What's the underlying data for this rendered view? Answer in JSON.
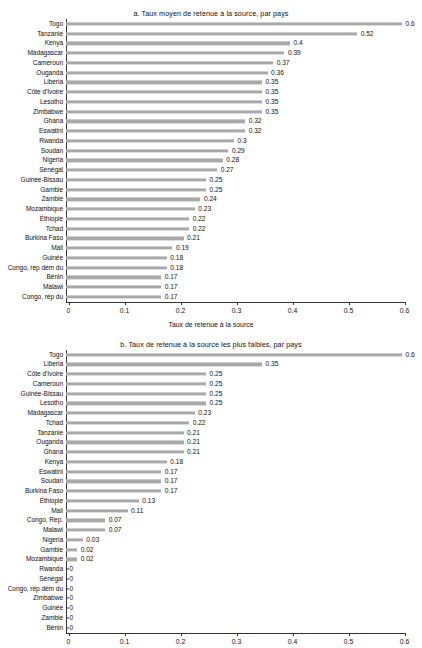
{
  "figure": {
    "panels": [
      {
        "id": "panel-a",
        "title": "a. Taux moyen de retenue à la source, par pays",
        "xlabel": "Taux de retenue à la source",
        "xticks": [
          "0",
          "0.1",
          "0.2",
          "0.3",
          "0.4",
          "0.5",
          "0.6"
        ]
      },
      {
        "id": "panel-b",
        "title": "b. Taux de retenue à la source les plus faibles, par pays",
        "xlabel": "",
        "xticks": [
          "0",
          "0.1",
          "0.2",
          "0.3",
          "0.4",
          "0.5",
          "0.6"
        ]
      }
    ]
  },
  "chart_data": [
    {
      "type": "bar",
      "orientation": "horizontal",
      "title": "a. Taux moyen de retenue à la source, par pays",
      "xlabel": "Taux de retenue à la source",
      "ylabel": "",
      "xlim": [
        0,
        0.6
      ],
      "xticks": [
        0,
        0.1,
        0.2,
        0.3,
        0.4,
        0.5,
        0.6
      ],
      "grid": false,
      "legend": "none",
      "bar_color": "#a9a9a9",
      "categories": [
        "Togo",
        "Tanzanie",
        "Kenya",
        "Madagascar",
        "Cameroun",
        "Ouganda",
        "Liberia",
        "Côte d'Ivoire",
        "Lesotho",
        "Zimbabwe",
        "Ghana",
        "Eswatini",
        "Rwanda",
        "Soudan",
        "Nigeria",
        "Sénégal",
        "Guinée-Bissau",
        "Gambie",
        "Zambie",
        "Mozambique",
        "Éthiopie",
        "Tchad",
        "Burkina Faso",
        "Mali",
        "Guinée",
        "Congo, rép dém du",
        "Bénin",
        "Malawi",
        "Congo, rép du"
      ],
      "values": [
        0.6,
        0.52,
        0.4,
        0.39,
        0.37,
        0.36,
        0.35,
        0.35,
        0.35,
        0.35,
        0.32,
        0.32,
        0.3,
        0.29,
        0.28,
        0.27,
        0.25,
        0.25,
        0.24,
        0.23,
        0.22,
        0.22,
        0.21,
        0.19,
        0.18,
        0.18,
        0.17,
        0.17,
        0.17
      ],
      "labels": [
        "0.6",
        "0.52",
        "0.4",
        "0.39",
        "0.37",
        "0.36",
        "0.35",
        "0.35",
        "0.35",
        "0.35",
        "0.32",
        "0.32",
        "0.3",
        "0.29",
        "0.28",
        "0.27",
        "0.25",
        "0.25",
        "0.24",
        "0.23",
        "0.22",
        "0.22",
        "0.21",
        "0.19",
        "0.18",
        "0.18",
        "0.17",
        "0.17",
        "0.17"
      ]
    },
    {
      "type": "bar",
      "orientation": "horizontal",
      "title": "b. Taux de retenue à la source les plus faibles, par pays",
      "xlabel": "",
      "ylabel": "",
      "xlim": [
        0,
        0.6
      ],
      "xticks": [
        0,
        0.1,
        0.2,
        0.3,
        0.4,
        0.5,
        0.6
      ],
      "grid": false,
      "legend": "none",
      "bar_color": "#a9a9a9",
      "categories": [
        "Togo",
        "Liberia",
        "Côte d'Ivoire",
        "Cameroun",
        "Guinée-Bissau",
        "Lesotho",
        "Madagascar",
        "Tchad",
        "Tanzanie",
        "Ouganda",
        "Ghana",
        "Kenya",
        "Eswatini",
        "Soudan",
        "Burkina Faso",
        "Éthiopie",
        "Mali",
        "Congo, Rep.",
        "Malawi",
        "Nigeria",
        "Gambie",
        "Mozambique",
        "Rwanda",
        "Sénégal",
        "Congo, rép dém du",
        "Zimbabwe",
        "Guinée",
        "Zambie",
        "Bénin"
      ],
      "values": [
        0.6,
        0.35,
        0.25,
        0.25,
        0.25,
        0.25,
        0.23,
        0.22,
        0.21,
        0.21,
        0.21,
        0.18,
        0.17,
        0.17,
        0.17,
        0.13,
        0.11,
        0.07,
        0.07,
        0.03,
        0.02,
        0.02,
        0,
        0,
        0,
        0,
        0,
        0,
        0
      ],
      "labels": [
        "0.6",
        "0.35",
        "0.25",
        "0.25",
        "0.25",
        "0.25",
        "0.23",
        "0.22",
        "0.21",
        "0.21",
        "0.21",
        "0.18",
        "0.17",
        "0.17",
        "0.17",
        "0.13",
        "0.11",
        "0.07",
        "0.07",
        "0.03",
        "0.02",
        "0.02",
        "0",
        "0",
        "0",
        "0",
        "0",
        "0",
        "0"
      ]
    }
  ]
}
